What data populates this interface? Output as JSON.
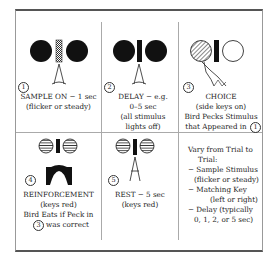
{
  "panels": [
    {
      "step": "1",
      "title": "SAMPLE ON − 1 sec",
      "lines": [
        "(flicker or steady)"
      ]
    },
    {
      "step": "2",
      "title": "DELAY − e.g.",
      "lines": [
        "0–5 sec",
        "(all stimulus",
        "lights off)"
      ]
    },
    {
      "step": "3",
      "title": "CHOICE",
      "lines": [
        "(side keys on)",
        "Bird Pecks Stimulus",
        "that Appeared in"
      ],
      "ref_step": "1"
    },
    {
      "step": "4",
      "title": "REINFORCEMENT",
      "lines": [
        "(keys red)",
        "Bird Eats if Peck in"
      ],
      "last_line": "was correct",
      "ref_step": "3"
    },
    {
      "step": "5",
      "title": "REST − 5 sec",
      "lines": [
        "(keys red)"
      ]
    }
  ],
  "notes": {
    "heading": [
      "Vary from Trial to",
      "Trial:"
    ],
    "items": [
      "− Sample Stimulus",
      "(flicker or steady)",
      "− Matching Key",
      "(left or right)",
      "− Delay (typically",
      "0, 1, 2, or 5 sec)"
    ]
  },
  "colors": {
    "ink": "#111111",
    "frame": "#555555",
    "divider": "#aaaaaa"
  }
}
